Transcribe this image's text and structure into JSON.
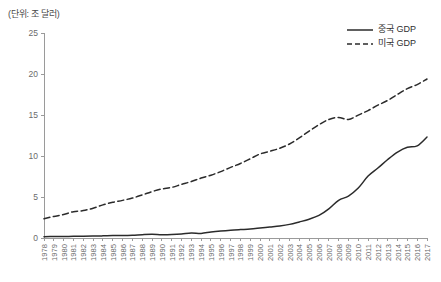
{
  "chart_data": {
    "type": "line",
    "title": "",
    "subtitle": "",
    "unit_label": "(단위: 조 달러)",
    "xlabel": "",
    "ylabel": "",
    "ylim": [
      0,
      25
    ],
    "yticks": [
      0,
      5,
      10,
      15,
      20,
      25
    ],
    "ytick_labels": [
      "0",
      "5",
      "10",
      "15",
      "20",
      "25"
    ],
    "grid": false,
    "legend_position": "top-right",
    "x": [
      1978,
      1979,
      1980,
      1981,
      1982,
      1983,
      1984,
      1985,
      1986,
      1987,
      1988,
      1989,
      1990,
      1991,
      1992,
      1993,
      1994,
      1995,
      1996,
      1997,
      1998,
      1999,
      2000,
      2001,
      2002,
      2003,
      2004,
      2005,
      2006,
      2007,
      2008,
      2009,
      2010,
      2011,
      2012,
      2013,
      2014,
      2015,
      2016,
      2017
    ],
    "xtick_labels": [
      "1978",
      "1979",
      "1980",
      "1981",
      "1982",
      "1983",
      "1984",
      "1985",
      "1986",
      "1987",
      "1988",
      "1989",
      "1990",
      "1991",
      "1992",
      "1993",
      "1994",
      "1995",
      "1996",
      "1997",
      "1998",
      "1999",
      "2000",
      "2001",
      "2002",
      "2003",
      "2004",
      "2005",
      "2006",
      "2007",
      "2008",
      "2009",
      "2010",
      "2011",
      "2012",
      "2013",
      "2014",
      "2015",
      "2016",
      "2017"
    ],
    "series": [
      {
        "name": "중국 GDP",
        "style": "solid",
        "color": "#2b2b2b",
        "values": [
          0.15,
          0.18,
          0.19,
          0.2,
          0.21,
          0.23,
          0.26,
          0.31,
          0.3,
          0.33,
          0.41,
          0.46,
          0.4,
          0.42,
          0.49,
          0.62,
          0.56,
          0.73,
          0.86,
          0.96,
          1.03,
          1.09,
          1.21,
          1.34,
          1.47,
          1.66,
          1.96,
          2.29,
          2.75,
          3.55,
          4.6,
          5.11,
          6.09,
          7.55,
          8.53,
          9.57,
          10.48,
          11.06,
          11.23,
          12.31
        ]
      },
      {
        "name": "미국 GDP",
        "style": "dashed",
        "color": "#2b2b2b",
        "values": [
          2.35,
          2.63,
          2.86,
          3.21,
          3.34,
          3.63,
          4.04,
          4.35,
          4.59,
          4.87,
          5.25,
          5.66,
          5.98,
          6.17,
          6.54,
          6.88,
          7.31,
          7.66,
          8.1,
          8.61,
          9.09,
          9.66,
          10.25,
          10.58,
          10.94,
          11.46,
          12.21,
          13.04,
          13.82,
          14.45,
          14.71,
          14.45,
          14.99,
          15.54,
          16.2,
          16.78,
          17.52,
          18.22,
          18.71,
          19.39
        ]
      }
    ]
  }
}
